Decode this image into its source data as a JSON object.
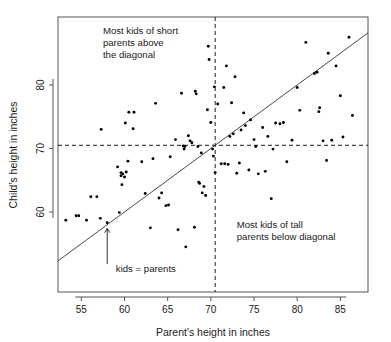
{
  "chart_data": {
    "type": "scatter",
    "title": "",
    "xlabel": "Parent's height in inches",
    "ylabel": "Child's height in inches",
    "xlim": [
      52.3,
      88.2
    ],
    "ylim": [
      47.4,
      90.7
    ],
    "xticks": [
      55,
      60,
      65,
      70,
      75,
      80,
      85
    ],
    "yticks": [
      60,
      70,
      80
    ],
    "grid": false,
    "legend": null,
    "reference_lines": [
      {
        "name": "identity-line",
        "kind": "diagonal",
        "equation": "y = x",
        "label": "kids = parents",
        "style": "solid"
      },
      {
        "name": "mean-parent-line",
        "kind": "vertical",
        "value": 70.5,
        "style": "dashed"
      },
      {
        "name": "mean-child-line",
        "kind": "horizontal",
        "value": 70.5,
        "style": "dashed"
      }
    ],
    "annotations": [
      {
        "name": "short-parents-note",
        "lines": [
          "Most kids of short",
          "parents above",
          "the diagonal"
        ],
        "x": 57.5,
        "y": 88.0
      },
      {
        "name": "tall-parents-note",
        "lines": [
          "Most kids of tall",
          "parents below diagonal"
        ],
        "x": 73.0,
        "y": 57.5
      },
      {
        "name": "identity-line-note",
        "lines": [
          "kids = parents"
        ],
        "x": 59.0,
        "y": 50.5
      }
    ],
    "points": [
      [
        53.2,
        58.7
      ],
      [
        54.4,
        59.4
      ],
      [
        54.7,
        59.4
      ],
      [
        55.6,
        58.7
      ],
      [
        56.1,
        62.4
      ],
      [
        56.8,
        62.4
      ],
      [
        57.2,
        59.0
      ],
      [
        57.3,
        73.0
      ],
      [
        58.0,
        58.3
      ],
      [
        59.2,
        67.1
      ],
      [
        59.4,
        59.9
      ],
      [
        59.6,
        65.7
      ],
      [
        59.6,
        66.2
      ],
      [
        59.7,
        64.3
      ],
      [
        59.8,
        66.0
      ],
      [
        60.0,
        65.5
      ],
      [
        60.1,
        74.0
      ],
      [
        60.2,
        66.3
      ],
      [
        60.4,
        68.0
      ],
      [
        60.5,
        75.7
      ],
      [
        61.0,
        73.1
      ],
      [
        61.1,
        75.7
      ],
      [
        62.0,
        67.9
      ],
      [
        62.4,
        62.9
      ],
      [
        63.0,
        57.5
      ],
      [
        63.3,
        68.4
      ],
      [
        63.6,
        77.1
      ],
      [
        64.0,
        62.2
      ],
      [
        64.3,
        63.0
      ],
      [
        64.8,
        61.0
      ],
      [
        65.1,
        61.1
      ],
      [
        65.3,
        68.7
      ],
      [
        65.9,
        71.4
      ],
      [
        66.2,
        57.2
      ],
      [
        66.6,
        78.7
      ],
      [
        66.8,
        70.4
      ],
      [
        66.9,
        69.9
      ],
      [
        67.0,
        70.3
      ],
      [
        67.1,
        54.5
      ],
      [
        67.4,
        72.0
      ],
      [
        67.6,
        71.2
      ],
      [
        67.8,
        70.9
      ],
      [
        68.1,
        57.6
      ],
      [
        68.2,
        79.0
      ],
      [
        68.3,
        78.6
      ],
      [
        68.5,
        70.3
      ],
      [
        68.6,
        64.7
      ],
      [
        68.7,
        64.5
      ],
      [
        68.9,
        69.3
      ],
      [
        69.0,
        63.0
      ],
      [
        69.2,
        64.0
      ],
      [
        69.4,
        62.6
      ],
      [
        69.6,
        76.1
      ],
      [
        69.7,
        86.1
      ],
      [
        69.8,
        84.0
      ],
      [
        70.0,
        74.1
      ],
      [
        70.2,
        69.9
      ],
      [
        70.3,
        68.8
      ],
      [
        70.4,
        79.7
      ],
      [
        70.5,
        66.2
      ],
      [
        70.8,
        77.0
      ],
      [
        71.2,
        67.6
      ],
      [
        71.5,
        79.6
      ],
      [
        71.6,
        67.6
      ],
      [
        71.8,
        83.0
      ],
      [
        72.0,
        67.5
      ],
      [
        72.2,
        71.9
      ],
      [
        72.4,
        77.2
      ],
      [
        72.6,
        72.3
      ],
      [
        72.8,
        81.3
      ],
      [
        73.0,
        66.1
      ],
      [
        73.3,
        67.7
      ],
      [
        73.5,
        72.9
      ],
      [
        73.8,
        75.6
      ],
      [
        74.0,
        73.6
      ],
      [
        74.4,
        66.6
      ],
      [
        74.6,
        74.5
      ],
      [
        75.0,
        71.4
      ],
      [
        75.2,
        70.3
      ],
      [
        75.5,
        66.0
      ],
      [
        76.0,
        73.3
      ],
      [
        76.3,
        66.4
      ],
      [
        76.6,
        71.9
      ],
      [
        77.0,
        62.1
      ],
      [
        77.2,
        69.9
      ],
      [
        77.5,
        74.0
      ],
      [
        78.0,
        73.9
      ],
      [
        78.4,
        74.1
      ],
      [
        78.8,
        67.9
      ],
      [
        79.4,
        71.3
      ],
      [
        80.0,
        79.6
      ],
      [
        80.3,
        76.0
      ],
      [
        81.0,
        86.7
      ],
      [
        82.0,
        81.8
      ],
      [
        82.3,
        82.0
      ],
      [
        82.5,
        75.8
      ],
      [
        82.6,
        76.4
      ],
      [
        83.0,
        71.2
      ],
      [
        83.4,
        68.1
      ],
      [
        83.6,
        85.0
      ],
      [
        84.0,
        71.3
      ],
      [
        84.5,
        83.0
      ],
      [
        85.0,
        78.3
      ],
      [
        85.3,
        71.8
      ],
      [
        86.0,
        87.5
      ],
      [
        86.4,
        75.2
      ]
    ]
  }
}
